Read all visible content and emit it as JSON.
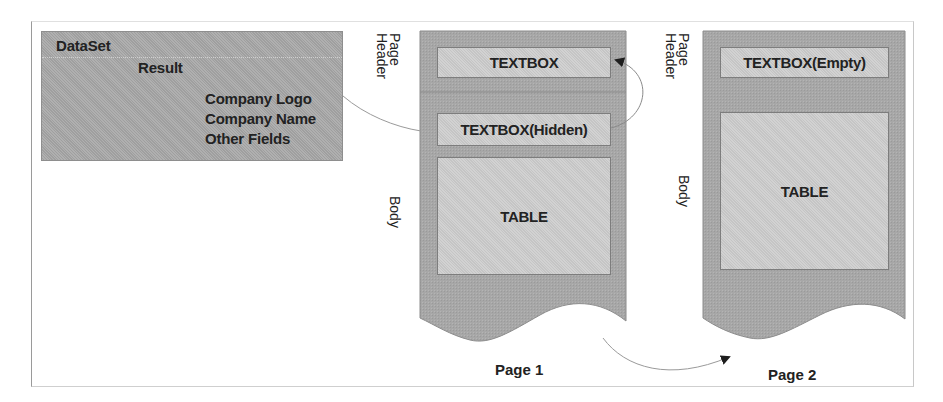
{
  "diagram": {
    "dataset": {
      "title": "DataSet",
      "result": "Result",
      "fields": [
        "Company Logo",
        "Company Name",
        "Other Fields"
      ]
    },
    "pages": [
      {
        "label": "Page 1",
        "section_labels": {
          "header_line1": "Page",
          "header_line2": "Header",
          "body": "Body"
        },
        "header_textbox": "TEXTBOX",
        "hidden_textbox": "TEXTBOX(Hidden)",
        "table": "TABLE"
      },
      {
        "label": "Page 2",
        "section_labels": {
          "header_line1": "Page",
          "header_line2": "Header",
          "body": "Body"
        },
        "header_textbox": "TEXTBOX(Empty)",
        "table": "TABLE"
      }
    ],
    "connectors": [
      {
        "from": "Company Name field",
        "to": "TEXTBOX(Hidden)",
        "style": "curve"
      },
      {
        "from": "TEXTBOX(Hidden)",
        "to": "TEXTBOX",
        "style": "curved-arrow"
      },
      {
        "from": "Page 1",
        "to": "Page 2",
        "style": "curved-arrow"
      }
    ],
    "colors": {
      "page_fill": "#a9a9a9",
      "textbox_fill": "#cdcdcd",
      "textbox_border": "#7d7d7d",
      "connector": "#9a9a9a",
      "arrowhead": "#1e1e1e",
      "text": "#222222"
    }
  }
}
